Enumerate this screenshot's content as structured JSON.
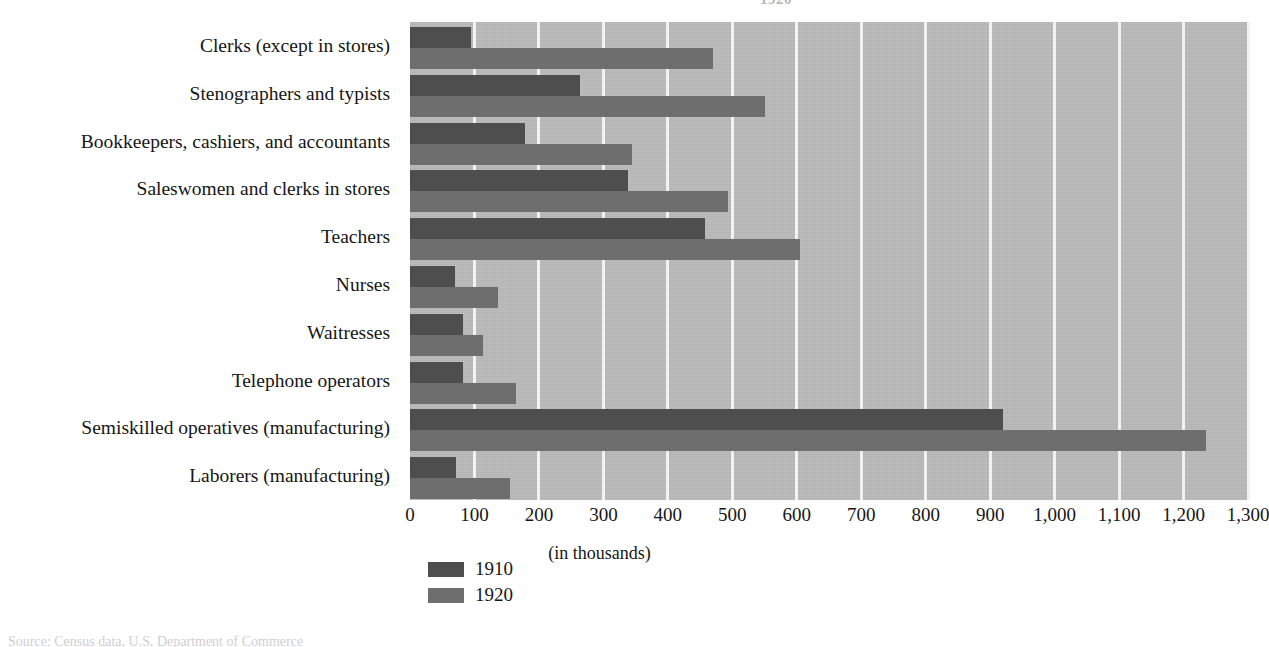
{
  "figure": {
    "title_remnant": "1920",
    "source_note": "Source: Census data, U.S. Department of Commerce"
  },
  "chart_data": {
    "type": "bar",
    "orientation": "horizontal",
    "title": "",
    "xlabel": "(in thousands)",
    "ylabel": "",
    "xlim": [
      0,
      1300
    ],
    "xticks": [
      0,
      100,
      200,
      300,
      400,
      500,
      600,
      700,
      800,
      900,
      1000,
      1100,
      1200,
      1300
    ],
    "xticklabels": [
      "0",
      "100",
      "200",
      "300",
      "400",
      "500",
      "600",
      "700",
      "800",
      "900",
      "1,000",
      "1,100",
      "1,200",
      "1,300"
    ],
    "grid": true,
    "grid_axis": "x",
    "legend_position": "bottom-left",
    "categories": [
      "Clerks (except in stores)",
      "Stenographers and typists",
      "Bookkeepers, cashiers, and accountants",
      "Saleswomen and clerks in stores",
      "Teachers",
      "Nurses",
      "Waitresses",
      "Telephone operators",
      "Semiskilled operatives (manufacturing)",
      "Laborers (manufacturing)"
    ],
    "series": [
      {
        "name": "1910",
        "color": "#4e4e4e",
        "values": [
          95,
          263,
          178,
          338,
          458,
          70,
          82,
          82,
          920,
          72
        ]
      },
      {
        "name": "1920",
        "color": "#6e6e6e",
        "values": [
          470,
          550,
          345,
          493,
          605,
          137,
          113,
          165,
          1235,
          155
        ]
      }
    ]
  }
}
